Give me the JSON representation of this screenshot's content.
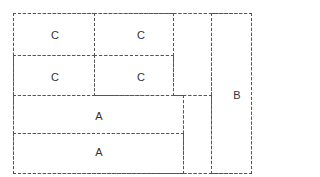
{
  "diagram": {
    "type": "layout-partition",
    "regions": [
      {
        "id": "c1",
        "label": "C"
      },
      {
        "id": "c2",
        "label": "C"
      },
      {
        "id": "c3",
        "label": "C"
      },
      {
        "id": "c4",
        "label": "C"
      },
      {
        "id": "a1",
        "label": "A"
      },
      {
        "id": "a2",
        "label": "A"
      },
      {
        "id": "b",
        "label": "B"
      }
    ]
  }
}
